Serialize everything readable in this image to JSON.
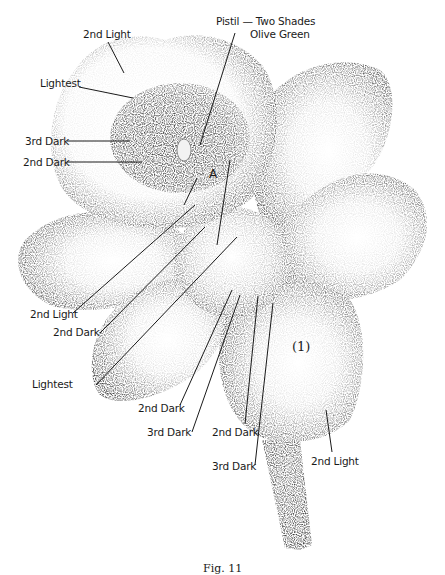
{
  "figure": {
    "marker_a": "A",
    "petal_number": "(1)",
    "caption": "Fig. 11"
  },
  "labels": {
    "pistil_line1": "Pistil — Two Shades",
    "pistil_line2": "Olive Green",
    "top_2nd_light": "2nd Light",
    "top_lightest": "Lightest",
    "top_3rd_dark": "3rd Dark",
    "top_2nd_dark": "2nd Dark",
    "left_2nd_light": "2nd Light",
    "left_2nd_dark": "2nd Dark",
    "left_lightest": "Lightest",
    "bottom_2nd_dark_a": "2nd Dark",
    "bottom_3rd_dark_a": "3rd Dark",
    "bottom_2nd_dark_b": "2nd Dark",
    "bottom_3rd_dark_b": "3rd Dark",
    "bottom_2nd_light": "2nd Light"
  },
  "colors": {
    "ink": "#1a1a1a",
    "paper": "#ffffff"
  }
}
